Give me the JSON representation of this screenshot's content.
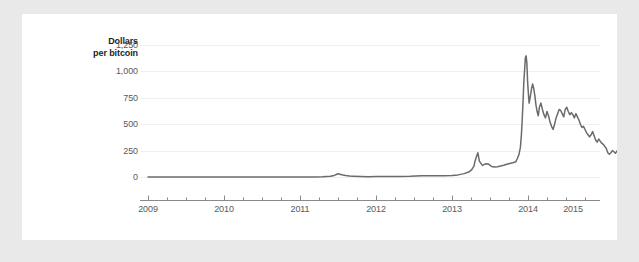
{
  "chart_data": {
    "type": "line",
    "title": "",
    "ylabel": "Dollars per bitcoin",
    "ylabel_lines": [
      "Dollars",
      "per bitcoin"
    ],
    "xlabel": "",
    "ylim": [
      0,
      1250
    ],
    "xlim": [
      2009.0,
      2015.4
    ],
    "grid": true,
    "legend": false,
    "line_color": "#6b6b6b",
    "grid_color": "#f0f0f0",
    "axis_color": "#8a8a8a",
    "tick_label_color": "#58595b",
    "label_color": "#231f20",
    "background_color": "#ffffff",
    "frame_color": "#e9e9e9",
    "yticks": [
      0,
      250,
      500,
      750,
      1000,
      1250
    ],
    "ytick_labels": [
      "0",
      "250",
      "500",
      "750",
      "1,000",
      "1,250"
    ],
    "xticks": [
      2009,
      2010,
      2011,
      2012,
      2013,
      2014,
      2015
    ],
    "xtick_labels": [
      "2009",
      "2010",
      "2011",
      "2012",
      "2013",
      "2014",
      "2015"
    ],
    "minor_xticks_per_year": 4,
    "series": [
      {
        "name": "Bitcoin price",
        "x": [
          2009.0,
          2009.25,
          2009.5,
          2009.75,
          2010.0,
          2010.25,
          2010.5,
          2010.6,
          2010.75,
          2010.9,
          2011.0,
          2011.1,
          2011.2,
          2011.3,
          2011.4,
          2011.45,
          2011.5,
          2011.55,
          2011.6,
          2011.65,
          2011.7,
          2011.8,
          2011.9,
          2012.0,
          2012.15,
          2012.3,
          2012.45,
          2012.6,
          2012.75,
          2012.9,
          2013.0,
          2013.08,
          2013.16,
          2013.22,
          2013.26,
          2013.29,
          2013.3,
          2013.32,
          2013.34,
          2013.36,
          2013.4,
          2013.44,
          2013.48,
          2013.52,
          2013.56,
          2013.6,
          2013.64,
          2013.68,
          2013.72,
          2013.76,
          2013.8,
          2013.84,
          2013.86,
          2013.88,
          2013.9,
          2013.915,
          2013.925,
          2013.935,
          2013.945,
          2013.955,
          2013.965,
          2013.975,
          2013.985,
          2013.995,
          2014.005,
          2014.015,
          2014.03,
          2014.045,
          2014.06,
          2014.075,
          2014.09,
          2014.105,
          2014.12,
          2014.135,
          2014.15,
          2014.17,
          2014.19,
          2014.21,
          2014.23,
          2014.25,
          2014.27,
          2014.29,
          2014.31,
          2014.33,
          2014.35,
          2014.37,
          2014.39,
          2014.41,
          2014.43,
          2014.45,
          2014.47,
          2014.49,
          2014.51,
          2014.53,
          2014.55,
          2014.57,
          2014.59,
          2014.61,
          2014.63,
          2014.65,
          2014.67,
          2014.69,
          2014.71,
          2014.73,
          2014.75,
          2014.77,
          2014.79,
          2014.81,
          2014.83,
          2014.85,
          2014.87,
          2014.89,
          2014.91,
          2014.93,
          2014.95,
          2014.97,
          2014.99,
          2015.01,
          2015.03,
          2015.05,
          2015.07,
          2015.09,
          2015.11,
          2015.13,
          2015.15,
          2015.17,
          2015.19,
          2015.21,
          2015.23,
          2015.25,
          2015.27,
          2015.29
        ],
        "y": [
          0,
          0,
          0,
          0,
          0,
          0,
          0.07,
          0.06,
          0.2,
          0.25,
          0.3,
          0.9,
          1.0,
          1.5,
          8,
          15,
          31,
          22,
          14,
          10,
          8,
          5,
          3.5,
          5,
          5,
          5,
          6.5,
          11,
          12,
          13,
          13.5,
          20,
          32,
          47,
          70,
          105,
          142,
          190,
          230,
          150,
          110,
          125,
          122,
          100,
          95,
          98,
          105,
          112,
          120,
          128,
          135,
          145,
          175,
          210,
          280,
          420,
          560,
          720,
          900,
          1010,
          1130,
          1147,
          1080,
          900,
          790,
          700,
          760,
          830,
          880,
          840,
          770,
          680,
          620,
          580,
          660,
          700,
          640,
          590,
          560,
          620,
          580,
          520,
          480,
          450,
          500,
          560,
          600,
          640,
          630,
          600,
          570,
          640,
          660,
          620,
          590,
          610,
          590,
          560,
          600,
          570,
          540,
          500,
          470,
          480,
          450,
          420,
          400,
          380,
          400,
          430,
          390,
          350,
          330,
          360,
          340,
          320,
          310,
          290,
          270,
          230,
          215,
          230,
          250,
          240,
          225,
          245,
          265,
          250,
          235,
          255,
          265,
          250
        ]
      }
    ]
  }
}
